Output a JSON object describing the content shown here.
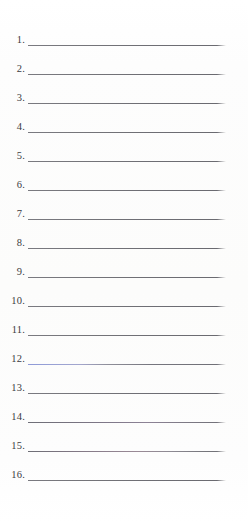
{
  "document": {
    "type": "numbered-blank-list-worksheet",
    "background_color": "#fdfdfc",
    "rule_color": "#6e6e74",
    "number_color": "#3b3b3f",
    "total_items": 16,
    "items": [
      {
        "number": "1.",
        "answer_text": "",
        "rule_tint": "grey",
        "top": 26
      },
      {
        "number": "2.",
        "answer_text": "",
        "rule_tint": "grey",
        "top": 55
      },
      {
        "number": "3.",
        "answer_text": "",
        "rule_tint": "grey",
        "top": 84
      },
      {
        "number": "4.",
        "answer_text": "",
        "rule_tint": "grey",
        "top": 113
      },
      {
        "number": "5.",
        "answer_text": "",
        "rule_tint": "grey",
        "top": 142
      },
      {
        "number": "6.",
        "answer_text": "",
        "rule_tint": "grey",
        "top": 171
      },
      {
        "number": "7.",
        "answer_text": "",
        "rule_tint": "grey",
        "top": 200
      },
      {
        "number": "8.",
        "answer_text": "",
        "rule_tint": "grey",
        "top": 229
      },
      {
        "number": "9.",
        "answer_text": "",
        "rule_tint": "grey",
        "top": 258
      },
      {
        "number": "10.",
        "answer_text": "",
        "rule_tint": "grey",
        "top": 287
      },
      {
        "number": "11.",
        "answer_text": "",
        "rule_tint": "grey",
        "top": 316
      },
      {
        "number": "12.",
        "answer_text": "",
        "rule_tint": "blue",
        "top": 345
      },
      {
        "number": "13.",
        "answer_text": "",
        "rule_tint": "grey",
        "top": 374
      },
      {
        "number": "14.",
        "answer_text": "",
        "rule_tint": "violet",
        "top": 403
      },
      {
        "number": "15.",
        "answer_text": "",
        "rule_tint": "rose",
        "top": 432
      },
      {
        "number": "16.",
        "answer_text": "",
        "rule_tint": "grey",
        "top": 461
      }
    ]
  }
}
